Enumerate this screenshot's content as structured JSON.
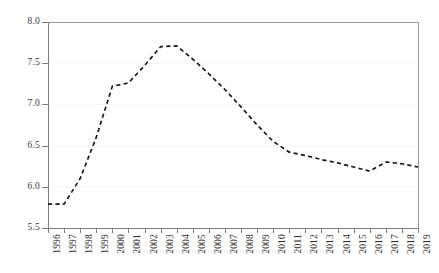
{
  "chart_data": {
    "type": "line",
    "title": "",
    "subtitle": "",
    "xlabel": "",
    "ylabel": "",
    "categories": [
      "1996",
      "1997",
      "1998",
      "1999",
      "2000",
      "2001",
      "2002",
      "2003",
      "2004",
      "2005",
      "2006",
      "2007",
      "2008",
      "2009",
      "2010",
      "2011",
      "2012",
      "2013",
      "2014",
      "2015",
      "2016",
      "2017",
      "2018",
      "2019"
    ],
    "x": [
      1996,
      1997,
      1998,
      1999,
      2000,
      2001,
      2002,
      2003,
      2004,
      2005,
      2006,
      2007,
      2008,
      2009,
      2010,
      2011,
      2012,
      2013,
      2014,
      2015,
      2016,
      2017,
      2018,
      2019
    ],
    "values": [
      5.79,
      5.79,
      6.1,
      6.6,
      7.22,
      7.26,
      7.47,
      7.7,
      7.71,
      7.55,
      7.37,
      7.18,
      6.97,
      6.75,
      6.55,
      6.42,
      6.38,
      6.33,
      6.29,
      6.24,
      6.19,
      6.3,
      6.28,
      6.24
    ],
    "series": [
      {
        "name": "series-1",
        "values": [
          5.79,
          5.79,
          6.1,
          6.6,
          7.22,
          7.26,
          7.47,
          7.7,
          7.71,
          7.55,
          7.37,
          7.18,
          6.97,
          6.75,
          6.55,
          6.42,
          6.38,
          6.33,
          6.29,
          6.24,
          6.19,
          6.3,
          6.28,
          6.24
        ],
        "style": "dashed",
        "color": "#1a1a1a"
      }
    ],
    "ylim": [
      5.5,
      8.0
    ],
    "yticks": [
      5.5,
      6.0,
      6.5,
      7.0,
      7.5,
      8.0
    ],
    "ytick_labels": [
      "5.5",
      "6.0",
      "6.5",
      "7.0",
      "7.5",
      "8.0"
    ],
    "xlim": [
      1996,
      2019
    ],
    "grid": true,
    "grid_axis": "y",
    "legend": false,
    "legend_position": "none",
    "annotations": []
  },
  "style": {
    "background": "#ffffff",
    "line_color": "#1a1a1a",
    "axis_color": "#7d7d7d",
    "grid_color": "#f4f4f4",
    "tick_label_color": "#2f2f2f"
  }
}
